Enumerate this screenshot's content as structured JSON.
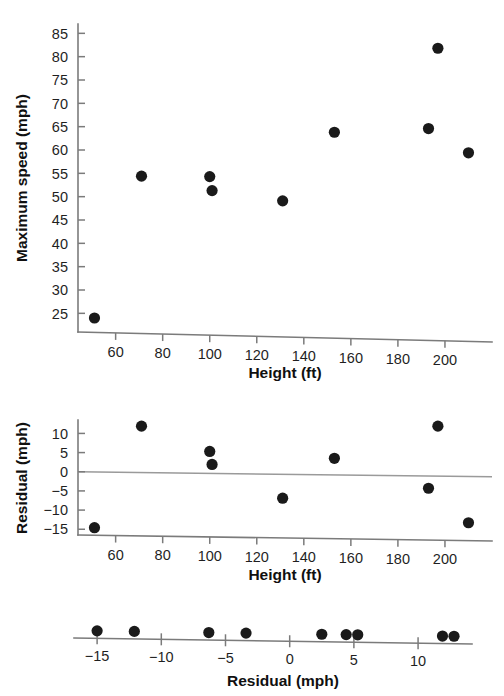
{
  "chart_data": [
    {
      "id": "scatter-height-speed",
      "type": "scatter",
      "title": "",
      "xlabel": "Height (ft)",
      "ylabel": "Maximum speed (mph)",
      "xlim": [
        44,
        220
      ],
      "ylim": [
        21,
        87
      ],
      "xticks": [
        60,
        80,
        100,
        120,
        140,
        160,
        180,
        200
      ],
      "xtick_labels": [
        "60",
        "80",
        "100",
        "120",
        "140",
        "160",
        "180",
        "200"
      ],
      "yticks": [
        25,
        30,
        35,
        40,
        45,
        50,
        55,
        60,
        65,
        70,
        75,
        80,
        85
      ],
      "ytick_labels": [
        "25",
        "30",
        "35",
        "40",
        "45",
        "50",
        "55",
        "60",
        "65",
        "70",
        "75",
        "80",
        "85"
      ],
      "grid": false,
      "legend": "none",
      "x": [
        51,
        71,
        100,
        101,
        131,
        153,
        193,
        197,
        210
      ],
      "y": [
        24.0,
        54.4,
        54.3,
        51.3,
        49.1,
        63.8,
        64.6,
        81.8,
        59.4
      ]
    },
    {
      "id": "residual-vs-height",
      "type": "scatter",
      "title": "",
      "xlabel": "Height (ft)",
      "ylabel": "Residual (mph)",
      "xlim": [
        44,
        220
      ],
      "ylim": [
        -16.5,
        13.5
      ],
      "xticks": [
        60,
        80,
        100,
        120,
        140,
        160,
        180,
        200
      ],
      "xtick_labels": [
        "60",
        "80",
        "100",
        "120",
        "140",
        "160",
        "180",
        "200"
      ],
      "yticks": [
        10,
        5,
        0,
        -5,
        -10,
        -15
      ],
      "ytick_labels": [
        "10",
        "5",
        "0",
        "−5",
        "−10",
        "−15"
      ],
      "grid": false,
      "reference_line": 0,
      "legend": "none",
      "x": [
        51,
        71,
        100,
        101,
        131,
        153,
        193,
        197,
        210
      ],
      "y": [
        -14.6,
        11.9,
        5.3,
        1.9,
        -6.9,
        3.5,
        -4.3,
        11.9,
        -13.3
      ]
    },
    {
      "id": "dotplot-residuals",
      "type": "scatter",
      "title": "",
      "xlabel": "Residual (mph)",
      "ylabel": "",
      "xlim": [
        -16.8,
        14.2
      ],
      "xticks": [
        -15,
        -10,
        -5,
        0,
        5,
        10
      ],
      "xtick_labels": [
        "−15",
        "−10",
        "−5",
        "0",
        "5",
        "10"
      ],
      "grid": false,
      "legend": "none",
      "values": [
        -14.6,
        -13.3,
        -6.9,
        -4.3,
        1.9,
        3.5,
        5.3,
        11.9,
        11.9
      ],
      "dot_positions": [
        -15.0,
        -12.1,
        -6.3,
        -3.4,
        2.5,
        4.4,
        5.3,
        11.9,
        12.8
      ]
    }
  ],
  "labels": {
    "chart1": {
      "ylabel": "Maximum speed (mph)",
      "xlabel": "Height (ft)",
      "ytick_labels": [
        "85",
        "80",
        "75",
        "70",
        "65",
        "60",
        "55",
        "50",
        "45",
        "40",
        "35",
        "30",
        "25"
      ],
      "xtick_labels": [
        "60",
        "80",
        "100",
        "120",
        "140",
        "160",
        "180",
        "200"
      ]
    },
    "chart2": {
      "ylabel": "Residual (mph)",
      "xlabel": "Height (ft)",
      "ytick_labels": [
        "10",
        "5",
        "0",
        "−5",
        "−10",
        "−15"
      ],
      "xtick_labels": [
        "60",
        "80",
        "100",
        "120",
        "140",
        "160",
        "180",
        "200"
      ]
    },
    "chart3": {
      "xlabel": "Residual (mph)",
      "xtick_labels": [
        "−15",
        "−10",
        "−5",
        "0",
        "5",
        "10"
      ]
    }
  },
  "colors": {
    "marker": "#1a1a1a",
    "axis": "#7b7b7b",
    "reference_line": "#9a9a9a",
    "text": "#1f1f1f",
    "background": "#ffffff"
  }
}
